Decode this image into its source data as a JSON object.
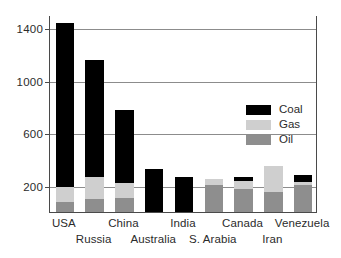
{
  "chart_data": {
    "type": "bar",
    "subtype": "stacked-vertical",
    "title": "",
    "xlabel": "",
    "ylabel": "",
    "ylim": [
      0,
      1500
    ],
    "yticks": [
      200,
      600,
      1000,
      1400
    ],
    "ytick_labels": [
      "200",
      "600",
      "1000",
      "1400"
    ],
    "grid": true,
    "legend_position": "upper-right-inside",
    "categories": [
      "USA",
      "Russia",
      "China",
      "Australia",
      "India",
      "S. Arabia",
      "Canada",
      "Iran",
      "Venezuela"
    ],
    "series": [
      {
        "name": "Oil",
        "color": "#8e8e8e",
        "values": [
          75,
          98,
          105,
          0,
          0,
          205,
          175,
          150,
          205
        ]
      },
      {
        "name": "Gas",
        "color": "#cfcfcf",
        "values": [
          115,
          167,
          115,
          0,
          0,
          45,
          60,
          200,
          20
        ]
      },
      {
        "name": "Coal",
        "color": "#000000",
        "values": [
          1250,
          890,
          560,
          325,
          265,
          0,
          30,
          0,
          55
        ]
      }
    ],
    "totals": [
      1440,
      1155,
      780,
      325,
      265,
      250,
      265,
      350,
      280
    ],
    "stack_order": [
      "Oil",
      "Gas",
      "Coal"
    ]
  },
  "axis": {
    "y_ticks": [
      {
        "label": "1400",
        "value": 1400
      },
      {
        "label": "1000",
        "value": 1000
      },
      {
        "label": "600",
        "value": 600
      },
      {
        "label": "200",
        "value": 200
      }
    ],
    "x_labels": [
      {
        "label": "USA",
        "row": 0
      },
      {
        "label": "Russia",
        "row": 1
      },
      {
        "label": "China",
        "row": 0
      },
      {
        "label": "Australia",
        "row": 1
      },
      {
        "label": "India",
        "row": 0
      },
      {
        "label": "S. Arabia",
        "row": 1
      },
      {
        "label": "Canada",
        "row": 0
      },
      {
        "label": "Iran",
        "row": 1
      },
      {
        "label": "Venezuela",
        "row": 0
      }
    ]
  },
  "legend": {
    "items": [
      {
        "label": "Coal",
        "color": "#000000"
      },
      {
        "label": "Gas",
        "color": "#cfcfcf"
      },
      {
        "label": "Oil",
        "color": "#8e8e8e"
      }
    ]
  }
}
